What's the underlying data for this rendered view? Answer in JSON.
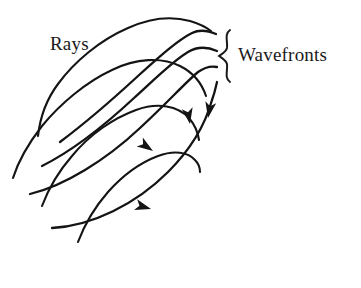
{
  "figure": {
    "background_color": "#ffffff",
    "ink_color": "#141414",
    "style": "hand-drawn line diagram"
  },
  "labels": {
    "rays": "Rays",
    "wavefronts": "Wavefronts"
  },
  "annotations": {
    "brace": "right-curly-brace grouping the wavefront curves"
  },
  "geometry": {
    "rays": {
      "count": 4,
      "description": "curved ray paths running from lower-left to upper-right, each terminating in an arrowhead",
      "paths": [
        "M 38 136 C 44 96, 78 46, 128 25 C 158 13, 186 17, 210 29",
        "M 13 178 C 30 146, 66 100, 112 72 C 146 52, 180 58, 203 82",
        "M 42 206 C 58 176, 90 138, 128 116 C 156 100, 180 106, 196 124",
        "M 78 240 C 92 212, 118 180, 148 160 C 168 147, 186 146, 198 156"
      ],
      "arrowheads": [
        {
          "x": 206,
          "y": 112,
          "angle": 75
        },
        {
          "x": 188,
          "y": 120,
          "angle": 60
        },
        {
          "x": 150,
          "y": 150,
          "angle": 30
        },
        {
          "x": 148,
          "y": 208,
          "angle": 18
        }
      ]
    },
    "wavefronts": {
      "count": 4,
      "description": "curves crossing the rays at right angles, fanning out from lower-left to upper-right",
      "paths": [
        "M 56 146 C 96 120, 150 74, 186 40 C 196 32, 206 28, 216 33",
        "M 40 168 C 84 150, 138 108, 176 66 C 188 54, 200 48, 216 50",
        "M 30 196 C 80 186, 136 152, 178 106 C 192 90, 204 76, 217 67",
        "M 50 228 C 104 226, 160 196, 196 150 C 206 136, 212 106, 217 83"
      ]
    },
    "brace": {
      "x": 228,
      "y_top": 30,
      "y_bottom": 82,
      "orientation": "right-curly"
    }
  }
}
